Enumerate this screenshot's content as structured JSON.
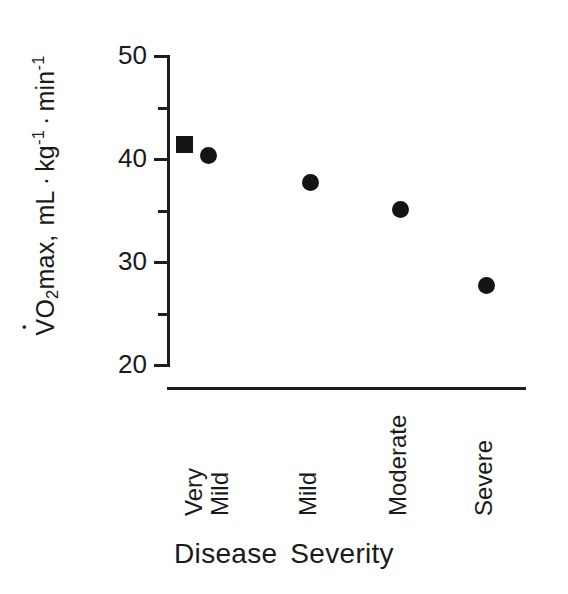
{
  "chart_data": {
    "type": "scatter",
    "title": "",
    "xlabel": "Disease  Severity",
    "xlabel_word1": "Disease",
    "xlabel_word2": "Severity",
    "ylabel_plain": "VO2max, mL · kg-1 · min-1",
    "ylabel_parts": {
      "v": "V",
      "o": "O",
      "sub2": "2",
      "max": "max,",
      "ml": "mL",
      "middot": "·",
      "kg": "kg",
      "exp_kg": "-1",
      "min": "min",
      "exp_min": "-1"
    },
    "categories": [
      "Very\nMild",
      "Mild",
      "Moderate",
      "Severe"
    ],
    "category_labels": [
      {
        "line1": "Very",
        "line2": "Mild"
      },
      {
        "line1": "Mild",
        "line2": ""
      },
      {
        "line1": "Moderate",
        "line2": ""
      },
      {
        "line1": "Severe",
        "line2": ""
      }
    ],
    "series": [
      {
        "name": "series-square",
        "marker": "square",
        "points": [
          {
            "category": "Very Mild",
            "value": 41.3
          }
        ]
      },
      {
        "name": "series-circle",
        "marker": "circle",
        "points": [
          {
            "category": "Very Mild",
            "value": 40.2
          },
          {
            "category": "Mild",
            "value": 37.6
          },
          {
            "category": "Moderate",
            "value": 35.0
          },
          {
            "category": "Severe",
            "value": 27.6
          }
        ]
      }
    ],
    "ylim": [
      20,
      50
    ],
    "y_major_ticks": [
      20,
      30,
      40,
      50
    ],
    "y_minor_ticks": [
      25,
      35,
      45
    ],
    "y_tick_labels": [
      "20",
      "30",
      "40",
      "50"
    ],
    "grid": false,
    "legend": "none",
    "marker_color": "#141414",
    "axis_color": "#1d1d1d"
  }
}
